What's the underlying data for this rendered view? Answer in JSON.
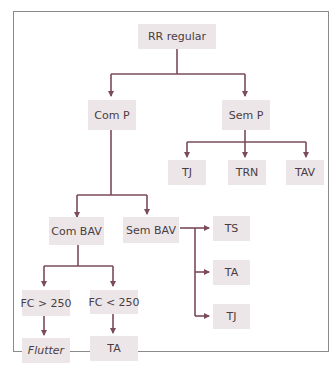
{
  "diagram": {
    "root": "RR regular",
    "level1": [
      "Com P",
      "Sem P"
    ],
    "sem_p_children": [
      "TJ",
      "TRN",
      "TAV"
    ],
    "com_p_children": [
      "Com BAV",
      "Sem BAV"
    ],
    "sem_bav_children": [
      "TS",
      "TA",
      "TJ"
    ],
    "com_bav_children": [
      "FC > 250",
      "FC < 250"
    ],
    "fc_gt_250_child": "Flutter",
    "fc_lt_250_child": "TA"
  },
  "colors": {
    "line": "#7b4a5c",
    "box": "#ede6e8",
    "text": "#4a3d42",
    "frame": "#8a8a8a"
  }
}
